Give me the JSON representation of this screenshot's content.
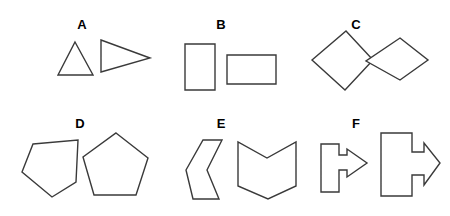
{
  "figure": {
    "width": 450,
    "height": 216,
    "background_color": "#ffffff",
    "stroke_color": "#3a3a3a",
    "fill_color": "#ffffff",
    "label_color": "#000000"
  },
  "panels": [
    {
      "id": "A",
      "label": "A",
      "label_x": 82,
      "label_y": 29,
      "shape_name": "triangle",
      "row": 1,
      "column": 1,
      "shapes": [
        {
          "name": "small-triangle",
          "role": "left",
          "points": "75,42 93,75 58,75"
        },
        {
          "name": "large-sideways-triangle",
          "role": "right",
          "points": "101,40 150,58 101,72"
        }
      ]
    },
    {
      "id": "B",
      "label": "B",
      "label_x": 221,
      "label_y": 29,
      "shape_name": "rectangle",
      "row": 1,
      "column": 2,
      "shapes": [
        {
          "name": "tall-rectangle",
          "role": "left",
          "points": "185,44 215,44 215,90 185,90"
        },
        {
          "name": "wide-rectangle",
          "role": "right",
          "points": "227,55 276,55 276,84 227,84"
        }
      ]
    },
    {
      "id": "C",
      "label": "C",
      "label_x": 356,
      "label_y": 29,
      "shape_name": "rhombus",
      "row": 1,
      "column": 3,
      "shapes": [
        {
          "name": "upright-rhombus",
          "role": "left",
          "points": "346,31 373,60 345,90 312,60"
        },
        {
          "name": "flat-rhombus",
          "role": "right",
          "points": "400,38 428,60 400,80 366,61"
        }
      ]
    },
    {
      "id": "D",
      "label": "D",
      "label_x": 80,
      "label_y": 128,
      "shape_name": "pentagon",
      "row": 2,
      "column": 1,
      "shapes": [
        {
          "name": "tilted-pentagon",
          "role": "left",
          "points": "33,144 78,140 76,182 52,197 22,172"
        },
        {
          "name": "upright-pentagon",
          "role": "right",
          "points": "116,133 148,158 136,195 94,195 83,157"
        }
      ]
    },
    {
      "id": "E",
      "label": "E",
      "label_x": 221,
      "label_y": 128,
      "shape_name": "chevron-hexagon",
      "row": 2,
      "column": 2,
      "shapes": [
        {
          "name": "left-pointing-chevron",
          "role": "left",
          "points": "203,140 222,140 207,170 219,199 193,199 186,170"
        },
        {
          "name": "down-pointing-chevron",
          "role": "right",
          "points": "238,142 238,186 268,199 296,186 296,142 267,158"
        }
      ]
    },
    {
      "id": "F",
      "label": "F",
      "label_x": 356,
      "label_y": 128,
      "shape_name": "arrow",
      "row": 2,
      "column": 3,
      "shapes": [
        {
          "name": "small-arrow",
          "role": "left",
          "points": "321,144 339,144 339,155 347,155 347,149 367,163 347,177 347,170 339,170 339,192 321,192"
        },
        {
          "name": "large-arrow",
          "role": "right",
          "points": "381,133 412,133 412,152 424,152 424,143 440,163 424,185 424,175 412,175 412,196 381,196"
        }
      ]
    }
  ]
}
